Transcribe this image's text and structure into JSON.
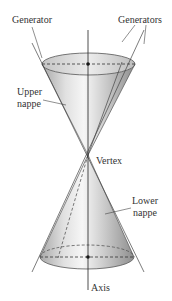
{
  "figure": {
    "labels": {
      "generator": "Generator",
      "generators": "Generators",
      "upper_nappe_line1": "Upper",
      "upper_nappe_line2": "nappe",
      "vertex": "Vertex",
      "lower_nappe_line1": "Lower",
      "lower_nappe_line2": "nappe",
      "axis": "Axis"
    },
    "colors": {
      "line": "#333333",
      "cone_light": "#f2f2f2",
      "cone_mid": "#cfcfcf",
      "cone_dark": "#9a9a9a",
      "rim_fill": "#dcdcdc"
    }
  }
}
